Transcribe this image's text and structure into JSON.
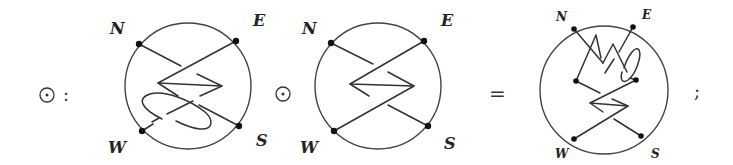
{
  "equation": {
    "operator_symbol": "⊙",
    "definition_colon": ":",
    "middle_operator": "⊙",
    "equals": "=",
    "terminator": ";"
  },
  "diagrams": [
    {
      "id": "left-tangle",
      "description": "Tangle in disk with crossing strands and a small encircling loop near W",
      "labels": {
        "N": "N",
        "E": "E",
        "W": "W",
        "S": "S"
      },
      "endpoints": 4
    },
    {
      "id": "middle-tangle",
      "description": "Tangle in disk with two crossing strands forming a zigzag",
      "labels": {
        "N": "N",
        "E": "E",
        "W": "W",
        "S": "S"
      },
      "endpoints": 4
    },
    {
      "id": "result-tangle",
      "description": "Composed tangle: top part with zigzag and small loop, bottom part with crossing zigzag",
      "labels": {
        "N": "N",
        "E": "E",
        "W": "W",
        "S": "S"
      },
      "endpoints": 6
    }
  ],
  "colors": {
    "stroke": "#333333",
    "dot": "#111111",
    "background": "#ffffff"
  }
}
